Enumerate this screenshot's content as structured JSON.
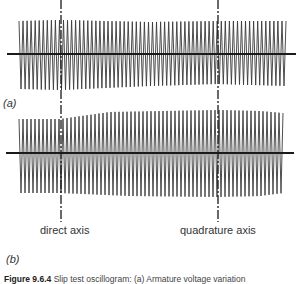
{
  "figure": {
    "panel_a_label": "(a)",
    "panel_b_label": "(b)",
    "direct_axis_label": "direct axis",
    "quadrature_axis_label": "quadrature axis",
    "caption_number": "Figure 9.6.4",
    "caption_text": "Slip test oscillogram: (a) Armature voltage variation"
  },
  "colors": {
    "trace": "#3a3a3a",
    "axis": "#1a1a1a",
    "background": "#ffffff"
  },
  "layout": {
    "direct_axis_x": 61,
    "quadrature_axis_x": 218,
    "panel_a": {
      "baseline_y": 54,
      "x_start": 19,
      "x_end": 286,
      "axis_x_start": 7,
      "axis_x_end": 296
    },
    "panel_b": {
      "baseline_y": 153,
      "x_start": 19,
      "x_end": 283,
      "axis_x_start": 6,
      "axis_x_end": 294
    }
  },
  "chart_data": [
    {
      "type": "line",
      "title": "(a) Armature voltage variation",
      "description": "High-frequency oscillation with slowly modulated amplitude envelope",
      "xlabel": "",
      "ylabel": "",
      "envelope_top": [
        [
          19,
          21
        ],
        [
          60,
          20
        ],
        [
          150,
          22
        ],
        [
          218,
          21
        ],
        [
          286,
          21
        ]
      ],
      "envelope_bottom": [
        [
          19,
          89
        ],
        [
          60,
          90
        ],
        [
          150,
          86
        ],
        [
          218,
          84
        ],
        [
          286,
          86
        ]
      ],
      "cycles": 66,
      "markers": [
        {
          "x": 61,
          "label": "direct axis"
        },
        {
          "x": 218,
          "label": "quadrature axis"
        }
      ]
    },
    {
      "type": "line",
      "title": "(b)",
      "description": "High-frequency oscillation with amplitude envelope varying between direct and quadrature axes",
      "xlabel": "",
      "ylabel": "",
      "envelope_top": [
        [
          19,
          119
        ],
        [
          60,
          119
        ],
        [
          110,
          112
        ],
        [
          218,
          110
        ],
        [
          260,
          111
        ],
        [
          283,
          113
        ]
      ],
      "envelope_bottom": [
        [
          19,
          193
        ],
        [
          60,
          193
        ],
        [
          130,
          196
        ],
        [
          218,
          197
        ],
        [
          260,
          196
        ],
        [
          283,
          193
        ]
      ],
      "cycles": 66,
      "markers": [
        {
          "x": 61,
          "label": "direct axis"
        },
        {
          "x": 218,
          "label": "quadrature axis"
        }
      ]
    }
  ]
}
